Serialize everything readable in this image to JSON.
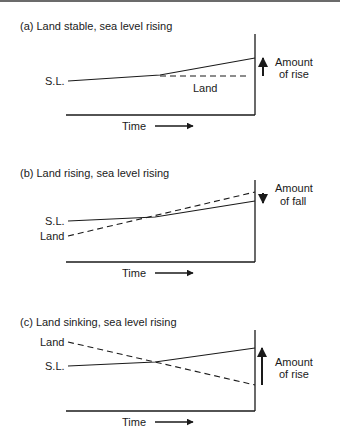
{
  "figure": {
    "panels": [
      {
        "id": "a",
        "title": "(a) Land stable, sea level rising",
        "sl_label": "S.L.",
        "land_label": "Land",
        "time_label": "Time",
        "change_label_line1": "Amount",
        "change_label_line2": "of rise",
        "change_direction": "up"
      },
      {
        "id": "b",
        "title": "(b) Land rising, sea level rising",
        "sl_label": "S.L.",
        "land_label": "Land",
        "time_label": "Time",
        "change_label_line1": "Amount",
        "change_label_line2": "of fall",
        "change_direction": "down"
      },
      {
        "id": "c",
        "title": "(c) Land sinking, sea level rising",
        "sl_label": "S.L.",
        "land_label": "Land",
        "time_label": "Time",
        "change_label_line1": "Amount",
        "change_label_line2": "of rise",
        "change_direction": "up"
      }
    ],
    "colors": {
      "ink": "#1a1a1a",
      "background": "#ffffff"
    }
  }
}
